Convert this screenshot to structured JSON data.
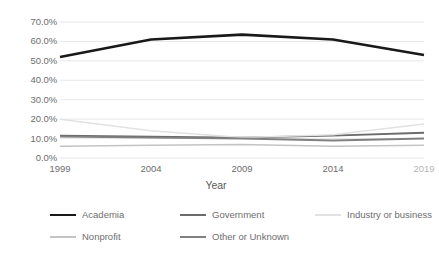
{
  "chart_data": {
    "type": "line",
    "title": "",
    "xlabel": "Year",
    "ylabel": "",
    "x": [
      1999,
      2004,
      2009,
      2014,
      2019
    ],
    "categories": [
      "1999",
      "2004",
      "2009",
      "2014",
      "2019"
    ],
    "xtick_labels": [
      "1999",
      "2004",
      "2009",
      "2014",
      "2019"
    ],
    "ytick_labels": [
      "70.0%",
      "60.0%",
      "50.0%",
      "40.0%",
      "30.0%",
      "20.0%",
      "10.0%",
      "0.0%"
    ],
    "ytick_values": [
      70,
      60,
      50,
      40,
      30,
      20,
      10,
      0
    ],
    "ylim": [
      0,
      70
    ],
    "xlim": [
      1999,
      2019
    ],
    "grid": "horizontal",
    "legend_position": "bottom",
    "series": [
      {
        "name": "Academia",
        "color": "#191919",
        "width": 2.6,
        "values": [
          52.0,
          61.0,
          63.5,
          61.0,
          53.0
        ]
      },
      {
        "name": "Government",
        "color": "#6b6b6b",
        "width": 1.9,
        "values": [
          11.5,
          11.0,
          10.5,
          11.5,
          13.0
        ]
      },
      {
        "name": "Industry or business",
        "color": "#e2e2e2",
        "width": 1.5,
        "values": [
          20.0,
          14.0,
          10.5,
          12.0,
          17.5
        ]
      },
      {
        "name": "Nonprofit",
        "color": "#c4c4c4",
        "width": 1.5,
        "values": [
          6.0,
          6.5,
          7.0,
          6.0,
          6.5
        ]
      },
      {
        "name": "Other or Unknown",
        "color": "#808080",
        "width": 1.9,
        "values": [
          11.0,
          10.5,
          10.0,
          9.0,
          10.0
        ]
      }
    ],
    "gridline_color": "#e8e8e8",
    "background_color": "#ffffff"
  },
  "legend": {
    "items": [
      {
        "label": "Academia"
      },
      {
        "label": "Government"
      },
      {
        "label": "Industry or business"
      },
      {
        "label": "Nonprofit"
      },
      {
        "label": "Other or Unknown"
      }
    ]
  }
}
